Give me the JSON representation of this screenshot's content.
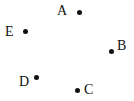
{
  "points": [
    {
      "label": "A",
      "dot": [
        79,
        12
      ],
      "label_pos": [
        56,
        4
      ]
    },
    {
      "label": "B",
      "dot": [
        111,
        51
      ],
      "label_pos": [
        117,
        39
      ]
    },
    {
      "label": "C",
      "dot": [
        78,
        90
      ],
      "label_pos": [
        85,
        83
      ]
    },
    {
      "label": "D",
      "dot": [
        37,
        78
      ],
      "label_pos": [
        19,
        75
      ]
    },
    {
      "label": "E",
      "dot": [
        25,
        31
      ],
      "label_pos": [
        5,
        25
      ]
    }
  ]
}
